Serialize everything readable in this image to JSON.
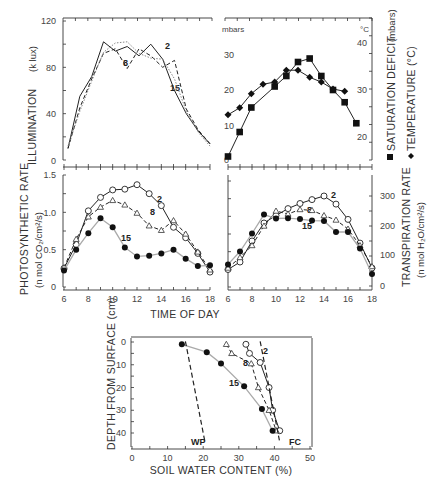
{
  "figure": {
    "xlabel_time": "TIME OF DAY",
    "panels": {
      "illumination": {
        "ylabel": "ILLUMINATION",
        "yunit": "(k lux)",
        "yticks": [
          "0",
          "40",
          "80",
          "120"
        ],
        "labels": {
          "s2": "2",
          "s8": "8",
          "s15": "15"
        }
      },
      "climate": {
        "left_unit": "mbars",
        "right_unit": "°C",
        "left_yticks": [
          "0",
          "10",
          "20",
          "30"
        ],
        "right_yticks": [
          "20",
          "30",
          "40"
        ],
        "ylabel_sat": "SATURATION DEFICIT",
        "ylabel_sat_unit": "(mbars)",
        "ylabel_temp": "TEMPERATURE (°C)"
      },
      "photosynthesis": {
        "ylabel": "PHOTOSYNTHETIC RATE",
        "yunit": "(n mol CO₂/cm²/s)",
        "yticks": [
          "0",
          "0.5",
          "1.0",
          "1.5"
        ],
        "xticks": [
          "6",
          "8",
          "10",
          "12",
          "14",
          "16",
          "18"
        ],
        "labels": {
          "s2": "2",
          "s8": "8",
          "s15": "15"
        }
      },
      "transpiration": {
        "ylabel": "TRANSPIRATION RATE",
        "yunit": "(n mol H₂O/cm²/s)",
        "yticks": [
          "0",
          "100",
          "200",
          "300"
        ],
        "xticks": [
          "6",
          "8",
          "10",
          "12",
          "14",
          "16",
          "18"
        ],
        "labels": {
          "s2": "2",
          "s8": "8",
          "s15": "15"
        }
      },
      "soil": {
        "xlabel": "SOIL WATER CONTENT   (%)",
        "ylabel": "DEPTH FROM SURFACE (cm)",
        "xticks": [
          "0",
          "10",
          "20",
          "30",
          "40",
          "50"
        ],
        "yticks": [
          "0",
          "10",
          "20",
          "30",
          "40"
        ],
        "wp_label": "WP",
        "fc_label": "FC",
        "labels": {
          "s2": "2",
          "s8": "8",
          "s15": "15"
        }
      }
    }
  },
  "chart_data": [
    {
      "type": "line",
      "title": "Illumination",
      "xlabel": "TIME OF DAY",
      "ylabel": "ILLUMINATION (k lux)",
      "ylim": [
        0,
        120
      ],
      "x": [
        6,
        7,
        8,
        9,
        10,
        11,
        12,
        13,
        14,
        15,
        16,
        17,
        18
      ],
      "series": [
        {
          "name": "2",
          "style": "solid",
          "values": [
            10,
            55,
            72,
            102,
            94,
            98,
            90,
            100,
            87,
            60,
            40,
            25,
            14
          ]
        },
        {
          "name": "8",
          "style": "dashed",
          "values": [
            10,
            45,
            70,
            92,
            96,
            79,
            96,
            90,
            80,
            86,
            44,
            26,
            14
          ]
        },
        {
          "name": "15",
          "style": "dotted",
          "values": [
            12,
            42,
            68,
            93,
            101,
            102,
            92,
            88,
            87,
            70,
            42,
            24,
            12
          ]
        }
      ]
    },
    {
      "type": "line",
      "title": "Saturation deficit and temperature",
      "xlabel": "TIME OF DAY",
      "x": [
        6,
        7,
        8,
        9,
        10,
        11,
        12,
        13,
        14,
        15,
        16,
        17,
        18
      ],
      "series": [
        {
          "name": "SATURATION DEFICIT (mbars)",
          "marker": "square",
          "axis": "left",
          "ylim": [
            0,
            40
          ],
          "values": [
            1,
            8,
            15,
            21,
            24,
            28,
            29,
            24,
            20,
            16.5,
            10.5
          ],
          "x": [
            6,
            7,
            8,
            10,
            11,
            12,
            13,
            14,
            15,
            16,
            17
          ]
        },
        {
          "name": "TEMPERATURE (°C)",
          "marker": "diamond",
          "axis": "right",
          "ylim": [
            16,
            42
          ],
          "values": [
            24.5,
            26,
            29,
            31,
            31.5,
            34,
            34,
            32.5,
            31.5,
            30,
            29.5
          ],
          "x": [
            6,
            7,
            8,
            9,
            10,
            11,
            12,
            13,
            14,
            15,
            16,
            17
          ]
        }
      ]
    },
    {
      "type": "line",
      "title": "Photosynthetic rate",
      "xlabel": "TIME OF DAY",
      "ylabel": "PHOTOSYNTHETIC RATE (n mol CO2/cm2/s)",
      "ylim": [
        0,
        1.5
      ],
      "x": [
        6,
        7,
        8,
        9,
        10,
        11,
        12,
        13,
        14,
        15,
        16,
        17,
        18
      ],
      "series": [
        {
          "name": "2",
          "marker": "open-circle",
          "values": [
            0.25,
            0.57,
            1.02,
            1.2,
            1.3,
            1.31,
            1.37,
            1.25,
            1.09,
            0.8,
            0.66,
            0.45,
            0.2
          ]
        },
        {
          "name": "8",
          "marker": "open-triangle",
          "values": [
            0.26,
            0.64,
            0.94,
            1.07,
            1.16,
            1.1,
            0.99,
            0.82,
            0.76,
            0.89,
            0.71,
            0.47,
            0.23
          ]
        },
        {
          "name": "15",
          "marker": "filled-circle",
          "values": [
            0.22,
            0.5,
            0.72,
            0.92,
            0.8,
            0.53,
            0.41,
            0.42,
            0.45,
            0.5,
            0.38,
            0.28,
            0.29
          ]
        }
      ]
    },
    {
      "type": "line",
      "title": "Transpiration rate",
      "xlabel": "TIME OF DAY",
      "ylabel": "TRANSPIRATION RATE (n mol H2O/cm2/s)",
      "ylim": [
        0,
        350
      ],
      "x": [
        6,
        7,
        8,
        9,
        10,
        11,
        12,
        13,
        14,
        15,
        16,
        17,
        18
      ],
      "series": [
        {
          "name": "2",
          "marker": "open-circle",
          "values": [
            55,
            80,
            150,
            210,
            235,
            258,
            275,
            288,
            300,
            273,
            222,
            143,
            60
          ]
        },
        {
          "name": "8",
          "marker": "open-triangle",
          "values": [
            60,
            95,
            135,
            200,
            250,
            240,
            255,
            252,
            235,
            220,
            190,
            135,
            65
          ]
        },
        {
          "name": "15",
          "marker": "filled-circle",
          "values": [
            72,
            115,
            175,
            238,
            225,
            226,
            223,
            218,
            217,
            180,
            180,
            125,
            40
          ]
        }
      ]
    },
    {
      "type": "line",
      "title": "Soil water profile",
      "xlabel": "SOIL WATER CONTENT (%)",
      "ylabel": "DEPTH FROM SURFACE (cm)",
      "xlim": [
        0,
        50
      ],
      "ylim": [
        45,
        0
      ],
      "series": [
        {
          "name": "2",
          "marker": "open-circle",
          "x": [
            32,
            33,
            36,
            38.5,
            39.5,
            41.5
          ],
          "y": [
            1,
            5,
            9,
            20,
            30,
            39
          ]
        },
        {
          "name": "8",
          "marker": "open-triangle",
          "x": [
            26.5,
            28,
            33.5,
            35.5,
            38.5,
            40.5
          ],
          "y": [
            1,
            5,
            9.5,
            20,
            30,
            39
          ]
        },
        {
          "name": "15",
          "marker": "filled-circle",
          "x": [
            14,
            21,
            25,
            31.5,
            36.5,
            39.5
          ],
          "y": [
            1,
            4.5,
            9.5,
            19.5,
            29.5,
            39
          ]
        },
        {
          "name": "WP",
          "style": "dashed",
          "x": [
            15,
            20.5
          ],
          "y": [
            1,
            44
          ]
        },
        {
          "name": "FC",
          "style": "dashed",
          "x": [
            36,
            41.5
          ],
          "y": [
            1,
            44
          ]
        }
      ]
    }
  ]
}
